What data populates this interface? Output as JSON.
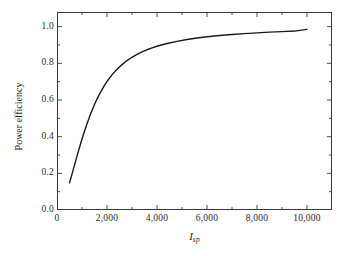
{
  "chart_data": {
    "type": "line",
    "title": "",
    "subtitle": "",
    "xlabel": "I_sp",
    "xlabel_parts": {
      "variable": "I",
      "subscript": "sp"
    },
    "ylabel": "Power efficiency",
    "xlim": [
      0,
      11000
    ],
    "ylim": [
      0.0,
      1.08
    ],
    "x_major_ticks": [
      0,
      2000,
      4000,
      6000,
      8000,
      10000
    ],
    "x_tick_labels": [
      "0",
      "2,000",
      "4,000",
      "6,000",
      "8,000",
      "10,000"
    ],
    "x_minor_interval": 1000,
    "y_major_ticks": [
      0.0,
      0.2,
      0.4,
      0.6,
      0.8,
      1.0
    ],
    "y_tick_labels": [
      "0.0",
      "0.2",
      "0.4",
      "0.6",
      "0.8",
      "1.0"
    ],
    "y_minor_interval": 0.1,
    "grid": false,
    "legend": false,
    "line_color": "#1a1a1a",
    "line_width": 1.4,
    "frame_color": "#3a3a3a",
    "background": "#ffffff",
    "series": [
      {
        "name": "Power efficiency",
        "x": [
          500,
          600,
          700,
          800,
          900,
          1000,
          1100,
          1200,
          1300,
          1400,
          1500,
          1600,
          1700,
          1800,
          1900,
          2000,
          2200,
          2400,
          2600,
          2800,
          3000,
          3200,
          3400,
          3600,
          3800,
          4000,
          4400,
          4800,
          5200,
          5600,
          6000,
          6500,
          7000,
          7500,
          8000,
          8500,
          9000,
          9500,
          10000
        ],
        "y": [
          0.148,
          0.196,
          0.245,
          0.294,
          0.341,
          0.387,
          0.43,
          0.47,
          0.508,
          0.543,
          0.575,
          0.605,
          0.632,
          0.657,
          0.68,
          0.701,
          0.737,
          0.768,
          0.793,
          0.815,
          0.833,
          0.849,
          0.862,
          0.874,
          0.884,
          0.893,
          0.908,
          0.92,
          0.93,
          0.938,
          0.945,
          0.952,
          0.957,
          0.962,
          0.966,
          0.97,
          0.973,
          0.976,
          0.985
        ]
      }
    ]
  }
}
